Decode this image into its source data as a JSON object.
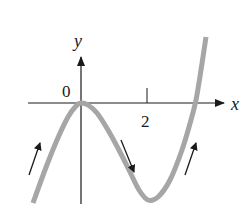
{
  "figure": {
    "type": "function-graph",
    "axes": {
      "x_label": "x",
      "y_label": "y",
      "origin_label": "0",
      "ticks": [
        {
          "value": 2,
          "label": "2"
        }
      ]
    },
    "curve": {
      "color": "#a6a6a6",
      "width": 5,
      "points": [
        [
          33,
          203
        ],
        [
          45,
          170
        ],
        [
          57,
          140
        ],
        [
          68,
          117
        ],
        [
          76,
          106
        ],
        [
          81,
          103
        ],
        [
          88,
          105
        ],
        [
          97,
          113
        ],
        [
          108,
          130
        ],
        [
          120,
          152
        ],
        [
          130,
          172
        ],
        [
          139,
          190
        ],
        [
          148,
          200
        ],
        [
          158,
          197
        ],
        [
          170,
          180
        ],
        [
          182,
          150
        ],
        [
          191,
          120
        ],
        [
          196,
          100
        ],
        [
          201,
          70
        ],
        [
          206,
          37
        ]
      ]
    },
    "arrows": [
      {
        "name": "increasing-left",
        "from": [
          29,
          175
        ],
        "to": [
          40,
          143
        ],
        "direction": "up"
      },
      {
        "name": "decreasing-middle",
        "from": [
          121,
          140
        ],
        "to": [
          134,
          172
        ],
        "direction": "down"
      },
      {
        "name": "increasing-right",
        "from": [
          185,
          175
        ],
        "to": [
          196,
          143
        ],
        "direction": "up"
      }
    ],
    "colors": {
      "axis": "#1a1a1a",
      "curve": "#a6a6a6",
      "arrow": "#1a1a1a",
      "background": "#ffffff"
    }
  }
}
